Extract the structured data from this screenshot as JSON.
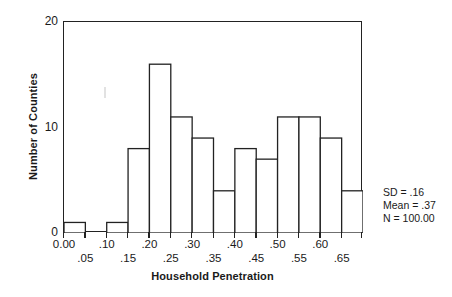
{
  "chart_data": {
    "type": "bar",
    "title": "",
    "xlabel": "Household Penetration",
    "ylabel": "Number of Counties",
    "categories": [
      "0.00",
      ".05",
      ".10",
      ".15",
      ".20",
      ".25",
      ".30",
      ".35",
      ".40",
      ".45",
      ".50",
      ".55",
      ".60",
      ".65"
    ],
    "bin_edges": [
      0.0,
      0.05,
      0.1,
      0.15,
      0.2,
      0.25,
      0.3,
      0.35,
      0.4,
      0.45,
      0.5,
      0.55,
      0.6,
      0.65,
      0.7
    ],
    "values": [
      1,
      0,
      1,
      8,
      16,
      11,
      9,
      4,
      8,
      7,
      11,
      11,
      9,
      4
    ],
    "xtick_labels": [
      "0.00",
      ".05",
      ".10",
      ".15",
      ".20",
      ".25",
      ".30",
      ".35",
      ".40",
      ".45",
      ".50",
      ".55",
      ".60",
      ".65"
    ],
    "ytick_labels": [
      "0",
      "10",
      "20"
    ],
    "ytick_values": [
      0,
      10,
      20
    ],
    "ylim": [
      0,
      20
    ],
    "xlim": [
      0.0,
      0.7
    ],
    "grid": false,
    "legend": "none",
    "bar_fill": "#ffffff",
    "bar_edge": "#222222",
    "frame_color": "#222222"
  },
  "stats": {
    "sd": "SD = .16",
    "mean": "Mean = .37",
    "n": "N = 100.00"
  },
  "axes": {
    "x_title": "Household Penetration",
    "y_title": "Number of Counties"
  }
}
